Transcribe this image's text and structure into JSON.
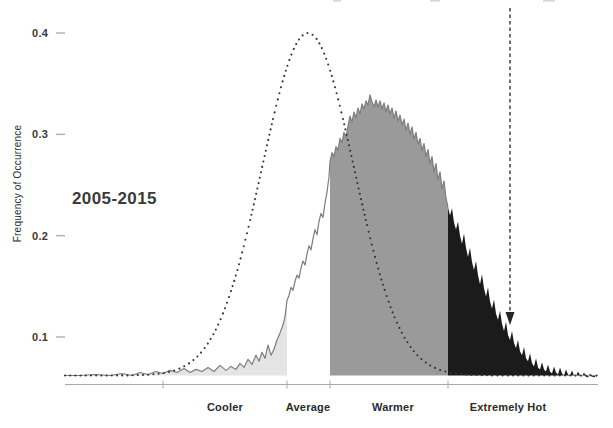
{
  "figure": {
    "period_label": "2005-2015",
    "ylabel": "Frequency of Occurrence"
  },
  "y_axis": {
    "ticks": [
      {
        "label": "0.4",
        "value": 0.4
      },
      {
        "label": "0.3",
        "value": 0.3
      },
      {
        "label": "0.2",
        "value": 0.2
      },
      {
        "label": "0.1",
        "value": 0.1
      }
    ]
  },
  "x_axis": {
    "categories": [
      {
        "label": "Cooler",
        "x": 225
      },
      {
        "label": "Average",
        "x": 308
      },
      {
        "label": "Warmer",
        "x": 393
      },
      {
        "label": "Extremely Hot",
        "x": 508
      }
    ]
  },
  "colors": {
    "cooler_fill": "#e4e4e4",
    "warmer_fill": "#9a9a9a",
    "extremely_hot_fill": "#1b1b1b",
    "curve_line": "#7d7d7d",
    "dotted_curve": "#333333",
    "axis": "#a8a8a8",
    "arrow": "#262626",
    "text": "#2b2b2b"
  },
  "chart_data": {
    "type": "area",
    "title": "",
    "xlabel": "",
    "ylabel": "Frequency of Occurrence",
    "ylim": [
      0.05,
      0.42
    ],
    "grid": false,
    "period": "2005-2015",
    "band_boundaries_px": [
      65,
      163,
      287,
      330,
      448,
      598
    ],
    "bands": [
      {
        "label": "",
        "x0": 65,
        "x1": 163,
        "fill": "#e4e4e4"
      },
      {
        "label": "Cooler",
        "x0": 163,
        "x1": 287,
        "fill": "#e4e4e4"
      },
      {
        "label": "Average",
        "x0": 287,
        "x1": 330,
        "fill": "none"
      },
      {
        "label": "Warmer",
        "x0": 330,
        "x1": 448,
        "fill": "#9a9a9a"
      },
      {
        "label": "Extremely Hot",
        "x0": 448,
        "x1": 598,
        "fill": "#1b1b1b"
      }
    ],
    "baseline_curve": {
      "name": "reference normal distribution (dotted)",
      "shape": "gaussian",
      "center_x_px": 308,
      "sigma_px": 46,
      "peak_frequency": 0.4,
      "tail_frequency": 0.062
    },
    "observed_series": {
      "name": "2005-2015 temperature frequency distribution",
      "points_x_f": [
        [
          65,
          0.062
        ],
        [
          80,
          0.062
        ],
        [
          95,
          0.063
        ],
        [
          110,
          0.062
        ],
        [
          122,
          0.064
        ],
        [
          132,
          0.062
        ],
        [
          140,
          0.065
        ],
        [
          148,
          0.063
        ],
        [
          156,
          0.066
        ],
        [
          163,
          0.064
        ],
        [
          170,
          0.067
        ],
        [
          177,
          0.065
        ],
        [
          184,
          0.069
        ],
        [
          190,
          0.065
        ],
        [
          196,
          0.068
        ],
        [
          202,
          0.066
        ],
        [
          208,
          0.07
        ],
        [
          214,
          0.066
        ],
        [
          220,
          0.072
        ],
        [
          226,
          0.067
        ],
        [
          231,
          0.071
        ],
        [
          236,
          0.068
        ],
        [
          240,
          0.074
        ],
        [
          244,
          0.07
        ],
        [
          248,
          0.078
        ],
        [
          252,
          0.073
        ],
        [
          256,
          0.082
        ],
        [
          259,
          0.076
        ],
        [
          262,
          0.085
        ],
        [
          265,
          0.079
        ],
        [
          268,
          0.092
        ],
        [
          271,
          0.082
        ],
        [
          274,
          0.088
        ],
        [
          277,
          0.097
        ],
        [
          280,
          0.104
        ],
        [
          283,
          0.112
        ],
        [
          285,
          0.12
        ],
        [
          287,
          0.136
        ],
        [
          289,
          0.141
        ],
        [
          291,
          0.149
        ],
        [
          293,
          0.146
        ],
        [
          295,
          0.155
        ],
        [
          297,
          0.161
        ],
        [
          299,
          0.158
        ],
        [
          301,
          0.168
        ],
        [
          303,
          0.175
        ],
        [
          305,
          0.171
        ],
        [
          307,
          0.182
        ],
        [
          309,
          0.19
        ],
        [
          311,
          0.186
        ],
        [
          313,
          0.197
        ],
        [
          315,
          0.206
        ],
        [
          317,
          0.201
        ],
        [
          319,
          0.214
        ],
        [
          321,
          0.222
        ],
        [
          323,
          0.218
        ],
        [
          325,
          0.232
        ],
        [
          327,
          0.243
        ],
        [
          329,
          0.258
        ],
        [
          330,
          0.273
        ],
        [
          332,
          0.282
        ],
        [
          334,
          0.278
        ],
        [
          336,
          0.288
        ],
        [
          338,
          0.284
        ],
        [
          340,
          0.296
        ],
        [
          342,
          0.292
        ],
        [
          344,
          0.302
        ],
        [
          346,
          0.297
        ],
        [
          348,
          0.308
        ],
        [
          350,
          0.318
        ],
        [
          352,
          0.312
        ],
        [
          354,
          0.322
        ],
        [
          356,
          0.316
        ],
        [
          358,
          0.326
        ],
        [
          360,
          0.32
        ],
        [
          362,
          0.33
        ],
        [
          364,
          0.325
        ],
        [
          366,
          0.333
        ],
        [
          368,
          0.329
        ],
        [
          370,
          0.339
        ],
        [
          372,
          0.332
        ],
        [
          374,
          0.327
        ],
        [
          376,
          0.334
        ],
        [
          378,
          0.327
        ],
        [
          380,
          0.333
        ],
        [
          382,
          0.325
        ],
        [
          384,
          0.331
        ],
        [
          386,
          0.322
        ],
        [
          388,
          0.329
        ],
        [
          390,
          0.32
        ],
        [
          392,
          0.326
        ],
        [
          394,
          0.316
        ],
        [
          396,
          0.323
        ],
        [
          398,
          0.313
        ],
        [
          400,
          0.319
        ],
        [
          402,
          0.309
        ],
        [
          404,
          0.315
        ],
        [
          406,
          0.304
        ],
        [
          408,
          0.311
        ],
        [
          410,
          0.3
        ],
        [
          412,
          0.307
        ],
        [
          414,
          0.295
        ],
        [
          416,
          0.302
        ],
        [
          418,
          0.29
        ],
        [
          420,
          0.296
        ],
        [
          422,
          0.284
        ],
        [
          424,
          0.291
        ],
        [
          426,
          0.278
        ],
        [
          428,
          0.285
        ],
        [
          430,
          0.271
        ],
        [
          432,
          0.278
        ],
        [
          434,
          0.263
        ],
        [
          436,
          0.271
        ],
        [
          438,
          0.255
        ],
        [
          440,
          0.263
        ],
        [
          442,
          0.246
        ],
        [
          444,
          0.254
        ],
        [
          446,
          0.237
        ],
        [
          448,
          0.228
        ],
        [
          450,
          0.22
        ],
        [
          452,
          0.227
        ],
        [
          454,
          0.213
        ],
        [
          456,
          0.206
        ],
        [
          458,
          0.214
        ],
        [
          460,
          0.2
        ],
        [
          462,
          0.192
        ],
        [
          464,
          0.202
        ],
        [
          466,
          0.188
        ],
        [
          468,
          0.179
        ],
        [
          470,
          0.188
        ],
        [
          472,
          0.174
        ],
        [
          474,
          0.166
        ],
        [
          476,
          0.175
        ],
        [
          478,
          0.161
        ],
        [
          480,
          0.152
        ],
        [
          482,
          0.162
        ],
        [
          484,
          0.148
        ],
        [
          486,
          0.14
        ],
        [
          488,
          0.149
        ],
        [
          490,
          0.135
        ],
        [
          492,
          0.128
        ],
        [
          494,
          0.137
        ],
        [
          496,
          0.123
        ],
        [
          498,
          0.117
        ],
        [
          500,
          0.126
        ],
        [
          502,
          0.113
        ],
        [
          504,
          0.106
        ],
        [
          506,
          0.115
        ],
        [
          508,
          0.102
        ],
        [
          510,
          0.097
        ],
        [
          512,
          0.106
        ],
        [
          514,
          0.094
        ],
        [
          516,
          0.089
        ],
        [
          518,
          0.097
        ],
        [
          520,
          0.086
        ],
        [
          522,
          0.082
        ],
        [
          524,
          0.09
        ],
        [
          526,
          0.079
        ],
        [
          528,
          0.076
        ],
        [
          530,
          0.084
        ],
        [
          532,
          0.074
        ],
        [
          534,
          0.071
        ],
        [
          536,
          0.079
        ],
        [
          538,
          0.07
        ],
        [
          540,
          0.068
        ],
        [
          542,
          0.075
        ],
        [
          544,
          0.068
        ],
        [
          546,
          0.066
        ],
        [
          548,
          0.073
        ],
        [
          550,
          0.066
        ],
        [
          552,
          0.064
        ],
        [
          554,
          0.071
        ],
        [
          556,
          0.065
        ],
        [
          558,
          0.063
        ],
        [
          560,
          0.07
        ],
        [
          562,
          0.064
        ],
        [
          564,
          0.062
        ],
        [
          566,
          0.068
        ],
        [
          568,
          0.063
        ],
        [
          570,
          0.062
        ],
        [
          572,
          0.067
        ],
        [
          574,
          0.062
        ],
        [
          576,
          0.061
        ],
        [
          578,
          0.066
        ],
        [
          580,
          0.062
        ],
        [
          582,
          0.061
        ],
        [
          584,
          0.065
        ],
        [
          586,
          0.061
        ],
        [
          588,
          0.06
        ],
        [
          590,
          0.064
        ],
        [
          592,
          0.061
        ],
        [
          594,
          0.06
        ],
        [
          596,
          0.062
        ],
        [
          597,
          0.06
        ]
      ]
    },
    "annotation_arrow": {
      "x": 510,
      "y_from": 8,
      "y_to": 311,
      "tip_y": 325,
      "points_to_band": "Extremely Hot"
    },
    "x_tick_marks_px": [
      163,
      287,
      330,
      448
    ],
    "axis_line": {
      "x0": 65,
      "x1": 598,
      "y": 384.5
    }
  }
}
